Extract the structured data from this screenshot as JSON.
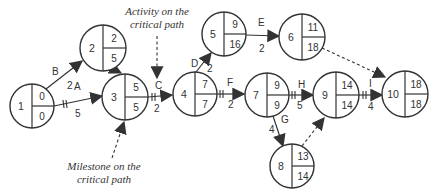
{
  "diagram": {
    "type": "critical-path-network",
    "annotations": {
      "activity_note_line1": "Activity on the",
      "activity_note_line2": "critical path",
      "milestone_note_line1": "Milestone on the",
      "milestone_note_line2": "critical path"
    },
    "nodes": [
      {
        "id": "1",
        "top": "0",
        "bottom": "0"
      },
      {
        "id": "2",
        "top": "2",
        "bottom": "5"
      },
      {
        "id": "3",
        "top": "5",
        "bottom": "5"
      },
      {
        "id": "4",
        "top": "7",
        "bottom": "7"
      },
      {
        "id": "5",
        "top": "9",
        "bottom": "16"
      },
      {
        "id": "6",
        "top": "11",
        "bottom": "18"
      },
      {
        "id": "7",
        "top": "9",
        "bottom": "9"
      },
      {
        "id": "9",
        "top": "14",
        "bottom": "14"
      },
      {
        "id": "10",
        "top": "18",
        "bottom": "18"
      },
      {
        "id": "8",
        "top": "13",
        "bottom": "14"
      }
    ],
    "activities": [
      {
        "name": "A",
        "duration": "5",
        "from": "1",
        "to": "3",
        "critical": true
      },
      {
        "name": "B",
        "duration": "2",
        "from": "1",
        "to": "2",
        "critical": false
      },
      {
        "name": "C",
        "duration": "2",
        "from": "3",
        "to": "4",
        "critical": true
      },
      {
        "name": "D",
        "duration": "2",
        "from": "4",
        "to": "5",
        "critical": false
      },
      {
        "name": "E",
        "duration": "2",
        "from": "5",
        "to": "6",
        "critical": false
      },
      {
        "name": "F",
        "duration": "2",
        "from": "4",
        "to": "7",
        "critical": true
      },
      {
        "name": "G",
        "duration": "4",
        "from": "7",
        "to": "8",
        "critical": false
      },
      {
        "name": "H",
        "duration": "5",
        "from": "7",
        "to": "9",
        "critical": true
      },
      {
        "name": "I",
        "duration": "4",
        "from": "9",
        "to": "10",
        "critical": true
      }
    ],
    "dummies": [
      {
        "from": "2",
        "to": "3"
      },
      {
        "from": "6",
        "to": "10"
      },
      {
        "from": "8",
        "to": "9"
      }
    ]
  }
}
